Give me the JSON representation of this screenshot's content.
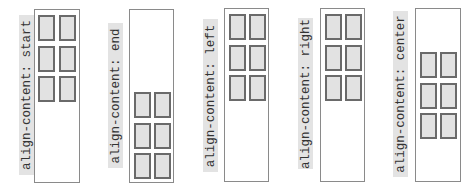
{
  "panels": [
    {
      "label": "align-content: start",
      "value": "start"
    },
    {
      "label": "align-content: end",
      "value": "end"
    },
    {
      "label": "align-content: left",
      "value": "left"
    },
    {
      "label": "align-content: right",
      "value": "right"
    },
    {
      "label": "align-content: center",
      "value": "center"
    }
  ],
  "grid": {
    "columns": 2,
    "rows": 3,
    "items": 6
  },
  "colors": {
    "item_fill": "#e2e2e2",
    "item_border": "#6a6a6a",
    "container_border": "#8a8a8a",
    "label_background": "#e3e3e3",
    "label_text": "#333333"
  }
}
